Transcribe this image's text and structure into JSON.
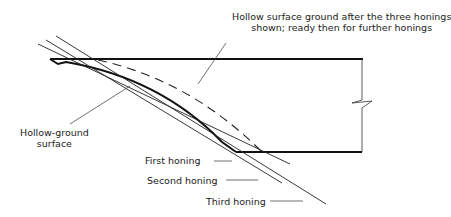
{
  "diagram": {
    "labels": {
      "top_line1": "Hollow surface ground after the three honings",
      "top_line2": "shown; ready then for further honings",
      "hollow_line1": "Hollow-ground",
      "hollow_line2": "surface",
      "first": "First honing",
      "second": "Second honing",
      "third": "Third honing"
    },
    "colors": {
      "stroke": "#1a1a1a",
      "text": "#222222",
      "background": "#ffffff"
    }
  }
}
